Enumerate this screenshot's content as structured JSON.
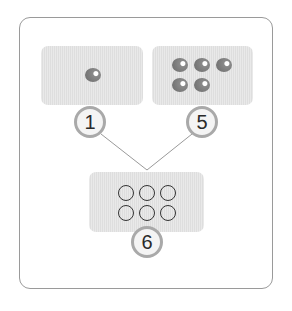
{
  "diagram": {
    "type": "number-bond",
    "parts": [
      {
        "label": "1",
        "dot_count": 1
      },
      {
        "label": "5",
        "dot_count": 5
      }
    ],
    "whole": {
      "label": "6",
      "empty_circle_count": 6
    }
  },
  "colors": {
    "frame_border": "#9a9a9a",
    "box_fill": "#e3e3e3",
    "dot_fill": "#7a7a7a",
    "badge_border": "#a9a9a9",
    "connector": "#9a9a9a"
  }
}
